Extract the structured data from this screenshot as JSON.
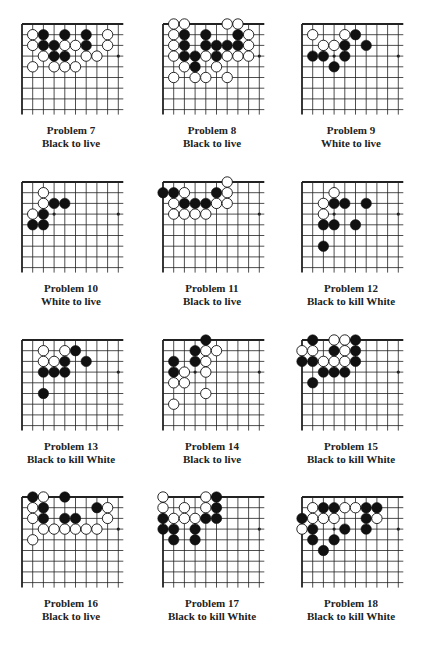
{
  "colors": {
    "black_stone": "#111111",
    "white_stone": "#ffffff",
    "grid": "#222222"
  },
  "board": {
    "columns": 10,
    "rows": 9
  },
  "problems": [
    {
      "number": "Problem 7",
      "task": "Black to live",
      "black": [
        [
          2,
          1
        ],
        [
          4,
          1
        ],
        [
          6,
          1
        ],
        [
          2,
          2
        ],
        [
          3,
          2
        ],
        [
          6,
          2
        ],
        [
          3,
          3
        ],
        [
          4,
          3
        ]
      ],
      "white": [
        [
          1,
          1
        ],
        [
          8,
          1
        ],
        [
          1,
          2
        ],
        [
          4,
          2
        ],
        [
          5,
          2
        ],
        [
          8,
          2
        ],
        [
          2,
          3
        ],
        [
          6,
          3
        ],
        [
          7,
          3
        ],
        [
          1,
          4
        ],
        [
          3,
          4
        ],
        [
          4,
          4
        ],
        [
          5,
          4
        ]
      ]
    },
    {
      "number": "Problem 8",
      "task": "Black to live",
      "black": [
        [
          2,
          1
        ],
        [
          4,
          1
        ],
        [
          7,
          1
        ],
        [
          2,
          2
        ],
        [
          4,
          2
        ],
        [
          5,
          2
        ],
        [
          6,
          2
        ],
        [
          7,
          2
        ],
        [
          2,
          3
        ],
        [
          3,
          3
        ],
        [
          5,
          3
        ],
        [
          3,
          4
        ]
      ],
      "white": [
        [
          1,
          0
        ],
        [
          2,
          0
        ],
        [
          6,
          0
        ],
        [
          7,
          0
        ],
        [
          1,
          1
        ],
        [
          8,
          1
        ],
        [
          1,
          2
        ],
        [
          8,
          2
        ],
        [
          1,
          3
        ],
        [
          4,
          3
        ],
        [
          6,
          3
        ],
        [
          7,
          3
        ],
        [
          8,
          3
        ],
        [
          2,
          4
        ],
        [
          5,
          4
        ],
        [
          1,
          5
        ],
        [
          3,
          5
        ],
        [
          4,
          5
        ],
        [
          6,
          5
        ]
      ]
    },
    {
      "number": "Problem 9",
      "task": "White to live",
      "black": [
        [
          5,
          1
        ],
        [
          4,
          2
        ],
        [
          6,
          2
        ],
        [
          1,
          3
        ],
        [
          2,
          3
        ],
        [
          4,
          3
        ],
        [
          3,
          4
        ]
      ],
      "white": [
        [
          1,
          1
        ],
        [
          4,
          1
        ],
        [
          2,
          2
        ],
        [
          3,
          2
        ]
      ]
    },
    {
      "number": "Problem 10",
      "task": "White to live",
      "black": [
        [
          3,
          2
        ],
        [
          4,
          2
        ],
        [
          2,
          3
        ],
        [
          1,
          4
        ],
        [
          2,
          4
        ]
      ],
      "white": [
        [
          2,
          1
        ],
        [
          2,
          2
        ],
        [
          1,
          3
        ]
      ]
    },
    {
      "number": "Problem 11",
      "task": "Black to live",
      "black": [
        [
          0,
          1
        ],
        [
          1,
          1
        ],
        [
          5,
          1
        ],
        [
          2,
          2
        ],
        [
          3,
          2
        ],
        [
          4,
          2
        ]
      ],
      "white": [
        [
          6,
          0
        ],
        [
          2,
          1
        ],
        [
          6,
          1
        ],
        [
          1,
          2
        ],
        [
          5,
          2
        ],
        [
          6,
          2
        ],
        [
          1,
          3
        ],
        [
          2,
          3
        ],
        [
          3,
          3
        ],
        [
          4,
          3
        ]
      ]
    },
    {
      "number": "Problem 12",
      "task": "Black to kill White",
      "black": [
        [
          3,
          2
        ],
        [
          4,
          2
        ],
        [
          6,
          2
        ],
        [
          2,
          4
        ],
        [
          3,
          4
        ],
        [
          5,
          4
        ],
        [
          2,
          6
        ]
      ],
      "white": [
        [
          3,
          1
        ],
        [
          2,
          2
        ],
        [
          2,
          3
        ]
      ]
    },
    {
      "number": "Problem 13",
      "task": "Black to kill White",
      "black": [
        [
          5,
          1
        ],
        [
          4,
          2
        ],
        [
          6,
          2
        ],
        [
          2,
          3
        ],
        [
          3,
          3
        ],
        [
          4,
          3
        ],
        [
          2,
          5
        ]
      ],
      "white": [
        [
          2,
          1
        ],
        [
          4,
          1
        ],
        [
          2,
          2
        ],
        [
          3,
          2
        ]
      ]
    },
    {
      "number": "Problem 14",
      "task": "Black to live",
      "black": [
        [
          4,
          0
        ],
        [
          3,
          1
        ],
        [
          1,
          2
        ],
        [
          3,
          2
        ],
        [
          1,
          3
        ]
      ],
      "white": [
        [
          4,
          1
        ],
        [
          5,
          1
        ],
        [
          4,
          2
        ],
        [
          2,
          3
        ],
        [
          4,
          3
        ],
        [
          1,
          4
        ],
        [
          2,
          4
        ],
        [
          4,
          5
        ],
        [
          1,
          6
        ]
      ]
    },
    {
      "number": "Problem 15",
      "task": "Black to kill White",
      "black": [
        [
          1,
          0
        ],
        [
          5,
          0
        ],
        [
          3,
          1
        ],
        [
          5,
          1
        ],
        [
          0,
          2
        ],
        [
          1,
          2
        ],
        [
          5,
          2
        ],
        [
          2,
          3
        ],
        [
          3,
          3
        ],
        [
          4,
          3
        ],
        [
          1,
          4
        ]
      ],
      "white": [
        [
          3,
          0
        ],
        [
          4,
          0
        ],
        [
          0,
          1
        ],
        [
          1,
          1
        ],
        [
          4,
          1
        ],
        [
          2,
          2
        ],
        [
          3,
          2
        ],
        [
          4,
          2
        ]
      ]
    },
    {
      "number": "Problem 16",
      "task": "Black to live",
      "black": [
        [
          1,
          0
        ],
        [
          4,
          0
        ],
        [
          2,
          1
        ],
        [
          7,
          1
        ],
        [
          2,
          2
        ],
        [
          4,
          2
        ],
        [
          5,
          2
        ]
      ],
      "white": [
        [
          2,
          0
        ],
        [
          1,
          1
        ],
        [
          8,
          1
        ],
        [
          1,
          2
        ],
        [
          8,
          2
        ],
        [
          2,
          3
        ],
        [
          3,
          3
        ],
        [
          4,
          3
        ],
        [
          5,
          3
        ],
        [
          6,
          3
        ],
        [
          7,
          3
        ],
        [
          1,
          4
        ]
      ]
    },
    {
      "number": "Problem 17",
      "task": "Black to kill White",
      "black": [
        [
          5,
          0
        ],
        [
          5,
          1
        ],
        [
          0,
          2
        ],
        [
          4,
          2
        ],
        [
          5,
          2
        ],
        [
          0,
          3
        ],
        [
          1,
          3
        ],
        [
          3,
          3
        ],
        [
          1,
          4
        ],
        [
          3,
          4
        ]
      ],
      "white": [
        [
          0,
          0
        ],
        [
          4,
          0
        ],
        [
          0,
          1
        ],
        [
          2,
          1
        ],
        [
          4,
          1
        ],
        [
          1,
          2
        ],
        [
          2,
          2
        ],
        [
          3,
          2
        ]
      ]
    },
    {
      "number": "Problem 18",
      "task": "Black to kill White",
      "black": [
        [
          2,
          1
        ],
        [
          3,
          1
        ],
        [
          6,
          1
        ],
        [
          7,
          1
        ],
        [
          0,
          2
        ],
        [
          6,
          2
        ],
        [
          1,
          3
        ],
        [
          4,
          3
        ],
        [
          6,
          3
        ],
        [
          1,
          4
        ],
        [
          3,
          4
        ],
        [
          2,
          5
        ]
      ],
      "white": [
        [
          1,
          1
        ],
        [
          4,
          1
        ],
        [
          5,
          1
        ],
        [
          1,
          2
        ],
        [
          2,
          2
        ],
        [
          3,
          2
        ],
        [
          7,
          2
        ],
        [
          0,
          3
        ]
      ]
    }
  ]
}
